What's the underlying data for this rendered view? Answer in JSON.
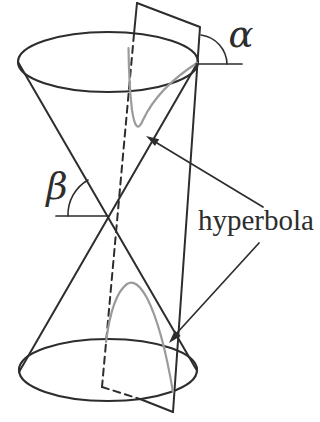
{
  "figure": {
    "labels": {
      "alpha": "α",
      "beta": "β",
      "curve": "hyperbola"
    },
    "colors": {
      "ink": "#2d2d2d",
      "curve_gray": "#9b9b9b",
      "background": "#ffffff"
    }
  }
}
